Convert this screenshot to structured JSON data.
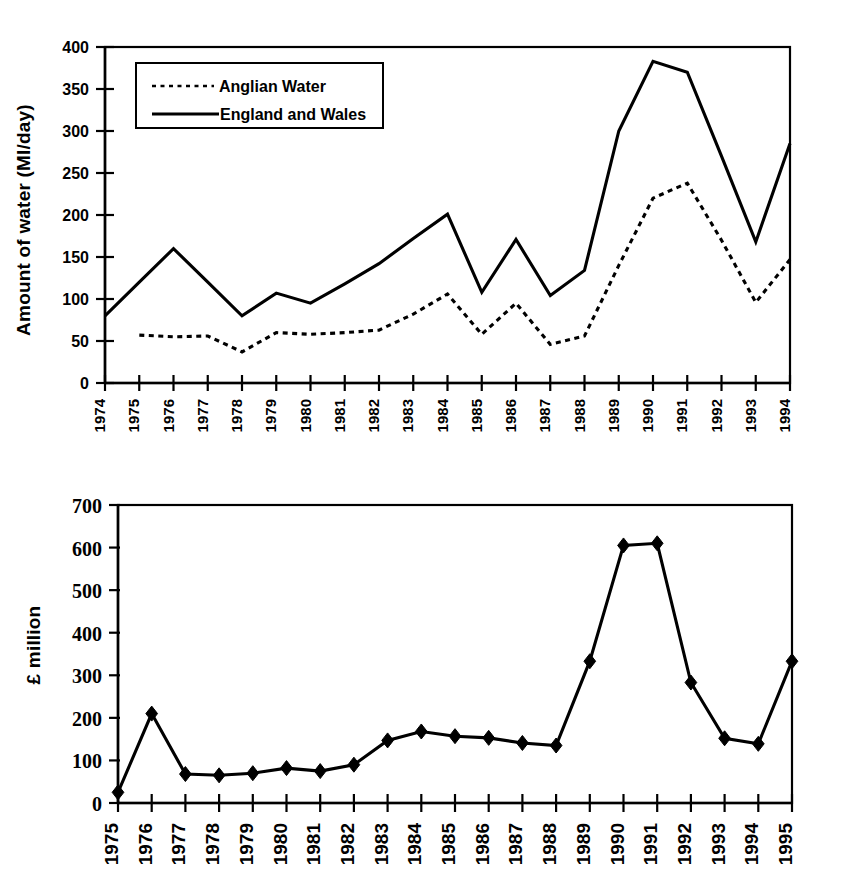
{
  "chart_data": [
    {
      "id": "top",
      "type": "line",
      "title": "",
      "xlabel": "",
      "ylabel": "Amount of water (Ml/day)",
      "ylim": [
        0,
        400
      ],
      "yticks": [
        0,
        50,
        100,
        150,
        200,
        250,
        300,
        350,
        400
      ],
      "grid": false,
      "legend_position": "top-left",
      "categories": [
        "1974",
        "1975",
        "1976",
        "1977",
        "1978",
        "1979",
        "1980",
        "1981",
        "1982",
        "1983",
        "1984",
        "1985",
        "1986",
        "1987",
        "1988",
        "1989",
        "1990",
        "1991",
        "1992",
        "1993",
        "1994"
      ],
      "series": [
        {
          "name": "Anglian Water",
          "style": "dotted",
          "values": [
            null,
            57,
            55,
            56,
            37,
            60,
            58,
            60,
            63,
            82,
            106,
            58,
            95,
            46,
            56,
            140,
            220,
            238,
            170,
            96,
            147
          ]
        },
        {
          "name": "England and Wales",
          "style": "solid",
          "values": [
            80,
            120,
            160,
            120,
            80,
            107,
            95,
            118,
            142,
            172,
            201,
            108,
            171,
            104,
            134,
            300,
            383,
            370,
            270,
            168,
            285
          ]
        }
      ]
    },
    {
      "id": "bottom",
      "type": "line",
      "title": "",
      "xlabel": "",
      "ylabel": "£ million",
      "ylim": [
        0,
        700
      ],
      "yticks": [
        0,
        100,
        200,
        300,
        400,
        500,
        600,
        700
      ],
      "grid": false,
      "legend_position": "none",
      "marker": "diamond",
      "categories": [
        "1975",
        "1976",
        "1977",
        "1978",
        "1979",
        "1980",
        "1981",
        "1982",
        "1983",
        "1984",
        "1985",
        "1986",
        "1987",
        "1988",
        "1989",
        "1990",
        "1991",
        "1992",
        "1993",
        "1994",
        "1995"
      ],
      "series": [
        {
          "name": "Capital expenditure",
          "style": "solid",
          "values": [
            25,
            210,
            68,
            65,
            70,
            82,
            75,
            90,
            147,
            168,
            157,
            153,
            141,
            135,
            333,
            605,
            610,
            283,
            152,
            139,
            333
          ]
        }
      ]
    }
  ],
  "top_chart": {
    "ylabel": "Amount of water (Ml/day)",
    "yticks": [
      "0",
      "50",
      "100",
      "150",
      "200",
      "250",
      "300",
      "350",
      "400"
    ],
    "xticks": [
      "1974",
      "1975",
      "1976",
      "1977",
      "1978",
      "1979",
      "1980",
      "1981",
      "1982",
      "1983",
      "1984",
      "1985",
      "1986",
      "1987",
      "1988",
      "1989",
      "1990",
      "1991",
      "1992",
      "1993",
      "1994"
    ],
    "legend": {
      "items": [
        {
          "label": "Anglian Water",
          "style": "dotted"
        },
        {
          "label": "England and Wales",
          "style": "solid"
        }
      ]
    }
  },
  "bottom_chart": {
    "ylabel": "£ million",
    "yticks": [
      "0",
      "100",
      "200",
      "300",
      "400",
      "500",
      "600",
      "700"
    ],
    "xticks": [
      "1975",
      "1976",
      "1977",
      "1978",
      "1979",
      "1980",
      "1981",
      "1982",
      "1983",
      "1984",
      "1985",
      "1986",
      "1987",
      "1988",
      "1989",
      "1990",
      "1991",
      "1992",
      "1993",
      "1994",
      "1995"
    ]
  },
  "colors": {
    "ink": "#000000",
    "paper": "#ffffff"
  }
}
